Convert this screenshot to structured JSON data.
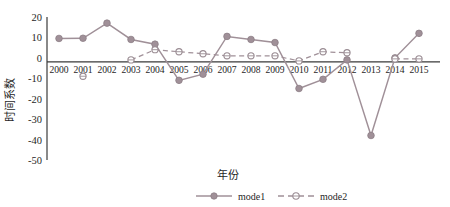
{
  "chart_data": {
    "type": "line",
    "title": "",
    "xlabel": "年份",
    "ylabel": "时间系数",
    "x": [
      2000,
      2001,
      2002,
      2003,
      2004,
      2005,
      2006,
      2007,
      2008,
      2009,
      2010,
      2011,
      2012,
      2013,
      2014,
      2015
    ],
    "categories": [
      "2000",
      "2001",
      "2002",
      "2003",
      "2004",
      "2005",
      "2006",
      "2007",
      "2008",
      "2009",
      "2010",
      "2011",
      "2012",
      "2013",
      "2014",
      "2015"
    ],
    "series": [
      {
        "name": "mode1",
        "style": "solid",
        "marker": "filled-circle",
        "color": "#a09098",
        "values": [
          9.5,
          9.6,
          17.0,
          9.0,
          6.7,
          -11.0,
          -8.0,
          10.5,
          9.0,
          7.5,
          -15.0,
          -10.5,
          -1.0,
          -38.0,
          0.0,
          12.0
        ]
      },
      {
        "name": "mode2",
        "style": "dashed",
        "marker": "open-circle",
        "color": "#a09098",
        "values": [
          null,
          -9.0,
          null,
          -1.0,
          4.0,
          3.0,
          2.0,
          1.0,
          1.0,
          1.0,
          -1.5,
          3.0,
          2.5,
          null,
          -0.5,
          -0.5
        ]
      }
    ],
    "ylim": [
      -50,
      20
    ],
    "yticks": [
      20,
      10,
      0,
      -10,
      -20,
      -30,
      -40,
      -50
    ],
    "ytick_labels": [
      "20",
      "10",
      "0",
      "-10",
      "-20",
      "-30",
      "-40",
      "-50"
    ],
    "xlim": [
      1999.5,
      2015.5
    ],
    "grid": false,
    "legend_position": "bottom-center",
    "zero_line": true
  },
  "legend": {
    "entries": [
      {
        "label": "mode1"
      },
      {
        "label": "mode2"
      }
    ]
  },
  "axis": {
    "y_title": "时间系数",
    "x_title": "年份"
  }
}
